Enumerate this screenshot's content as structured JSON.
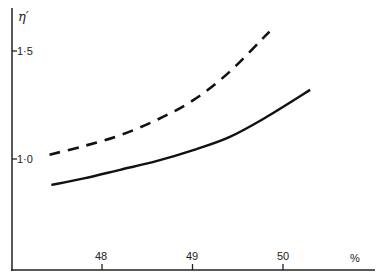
{
  "chart_data": {
    "type": "line",
    "title": "",
    "xlabel": "%",
    "ylabel": "η'",
    "x_ticks": [
      48,
      49,
      50
    ],
    "x_tick_labels": [
      "48",
      "49",
      "50"
    ],
    "y_ticks": [
      1.0,
      1.5
    ],
    "y_tick_labels": [
      "1·0",
      "1·5"
    ],
    "xlim": [
      47.1,
      51.0
    ],
    "ylim": [
      0.5,
      1.7
    ],
    "grid": false,
    "legend": null,
    "series": [
      {
        "name": "dashed",
        "style": "dashed",
        "x": [
          47.42,
          47.8,
          48.2,
          48.6,
          49.0,
          49.4,
          49.85
        ],
        "y": [
          1.02,
          1.06,
          1.11,
          1.18,
          1.27,
          1.4,
          1.59
        ]
      },
      {
        "name": "solid",
        "style": "solid",
        "x": [
          47.44,
          47.8,
          48.2,
          48.6,
          49.0,
          49.4,
          49.8,
          50.3
        ],
        "y": [
          0.88,
          0.91,
          0.95,
          0.99,
          1.04,
          1.1,
          1.19,
          1.32
        ]
      }
    ]
  },
  "axes": {
    "y_label": "η′",
    "x_unit": "%",
    "y_ticks": [
      {
        "label": "1·5",
        "value": 1.5
      },
      {
        "label": "1·0",
        "value": 1.0
      }
    ],
    "x_ticks": [
      {
        "label": "48",
        "value": 48
      },
      {
        "label": "49",
        "value": 49
      },
      {
        "label": "50",
        "value": 50
      }
    ]
  }
}
